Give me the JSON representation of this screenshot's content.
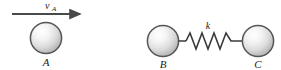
{
  "figure": {
    "background_color": "#ffffff",
    "width": 281,
    "height": 70,
    "stroke_color": "#3a3a3a",
    "sphere_outline_color": "#555555",
    "sphere_fill_light": "#fbfbfb",
    "sphere_fill_mid": "#e2e2e2",
    "sphere_fill_dark": "#b0b0b0",
    "velocity_arrow": {
      "label": "v",
      "subscript": "A",
      "direction": "right",
      "x_start": 12,
      "x_end": 86,
      "y": 14
    },
    "balls": [
      {
        "id": "A",
        "label": "A",
        "cx": 46,
        "cy": 38,
        "r": 16
      },
      {
        "id": "B",
        "label": "B",
        "cx": 163,
        "cy": 41,
        "r": 16
      },
      {
        "id": "C",
        "label": "C",
        "cx": 258,
        "cy": 41,
        "r": 16
      }
    ],
    "spring": {
      "label": "k",
      "x_start": 179,
      "x_end": 242,
      "y": 41,
      "coils": 7,
      "amplitude": 8
    }
  }
}
